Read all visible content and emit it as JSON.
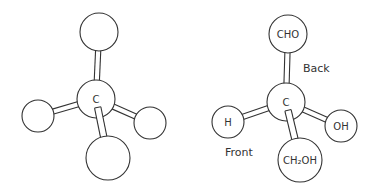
{
  "diagram": {
    "type": "ball-and-stick molecular models",
    "stroke_color": "#333333",
    "background": "#ffffff",
    "models": [
      {
        "name": "generic-tetrahedral-carbon",
        "center": {
          "label": "C",
          "x": 96,
          "y": 99,
          "r": 19
        },
        "substituents": [
          {
            "position": "top",
            "label": "",
            "x": 99,
            "y": 32,
            "r": 19
          },
          {
            "position": "left",
            "label": "",
            "x": 38,
            "y": 116,
            "r": 16
          },
          {
            "position": "right",
            "label": "",
            "x": 150,
            "y": 123,
            "r": 16
          },
          {
            "position": "bottom",
            "label": "",
            "x": 108,
            "y": 158,
            "r": 22
          }
        ]
      },
      {
        "name": "glyceraldehyde",
        "center": {
          "label": "C",
          "x": 286,
          "y": 102,
          "r": 19
        },
        "substituents": [
          {
            "position": "top",
            "label": "CHO",
            "x": 288,
            "y": 34,
            "r": 19
          },
          {
            "position": "left",
            "label": "H",
            "x": 228,
            "y": 122,
            "r": 16
          },
          {
            "position": "right",
            "label": "OH",
            "x": 341,
            "y": 126,
            "r": 16
          },
          {
            "position": "bottom",
            "label": "CH₂OH",
            "x": 300,
            "y": 160,
            "r": 22
          }
        ],
        "annotations": [
          {
            "text": "Back",
            "x": 303,
            "y": 72
          },
          {
            "text": "Front",
            "x": 225,
            "y": 156
          }
        ]
      }
    ]
  }
}
